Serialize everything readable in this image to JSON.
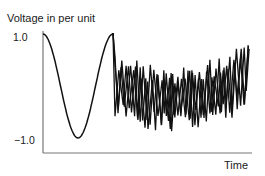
{
  "chart_data": {
    "type": "line",
    "title": "",
    "ylabel": "Voltage in per unit",
    "xlabel": "Time",
    "yticks": [
      "1.0",
      "−1.0"
    ],
    "ylim": [
      -1.0,
      1.0
    ],
    "grid": false,
    "legend": null,
    "annotations": [],
    "series": [
      {
        "name": "pre-disturbance sine",
        "description": "One full cycle of a 1.0 p.u. sinusoid, starting at +1.0 peak, trough at -1.0, returning to +1.0",
        "x": [
          0,
          0.25,
          0.5,
          0.75,
          1.0
        ],
        "y": [
          1.0,
          0.0,
          -1.0,
          0.0,
          1.0
        ]
      },
      {
        "name": "distorted / noisy waveform (overlapping traces)",
        "description": "After the sinusoid, the voltage abruptly becomes a dense, high-frequency noisy signal with several overlapping traces, fluctuating roughly between +0.8 and -0.5 p.u.",
        "y_range": [
          -0.5,
          0.85
        ]
      }
    ]
  },
  "labels": {
    "y_title": "Voltage in per unit",
    "y_tick_top": "1.0",
    "y_tick_bottom": "−1.0",
    "x_title": "Time"
  },
  "colors": {
    "line": "#111111",
    "axis": "#777777",
    "background": "#ffffff"
  }
}
